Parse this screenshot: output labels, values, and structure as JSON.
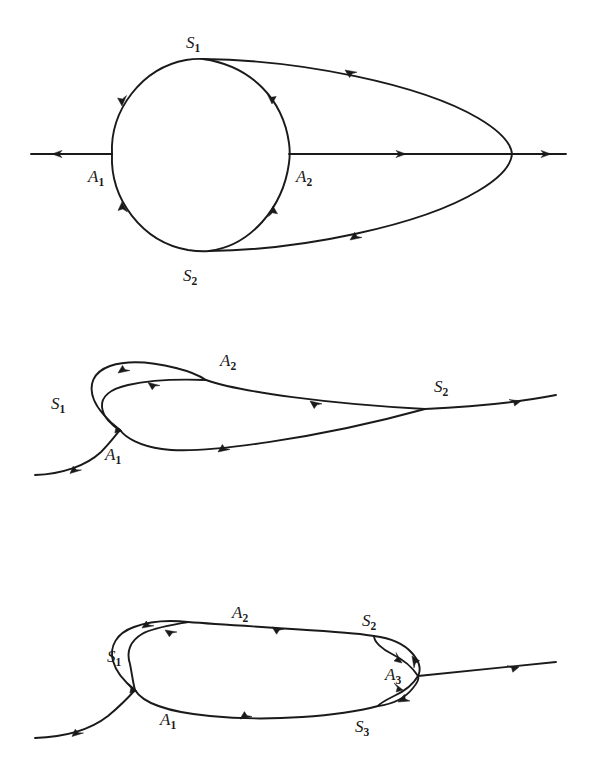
{
  "page": {
    "background_color": "#ffffff",
    "ink_color": "#1a1a1a",
    "width": 592,
    "height": 761,
    "figure_count": 3
  },
  "figures": [
    {
      "id": "figure-1",
      "name": "two-saddle-circle-with-outer-loop",
      "labels": [
        {
          "id": "f1-S1",
          "base": "S",
          "sub": "1",
          "x": 186,
          "y": 48,
          "role": "saddle-point-label"
        },
        {
          "id": "f1-A1",
          "base": "A",
          "sub": "1",
          "x": 88,
          "y": 182,
          "role": "equilibrium-point-label"
        },
        {
          "id": "f1-A2",
          "base": "A",
          "sub": "2",
          "x": 296,
          "y": 182,
          "role": "equilibrium-point-label"
        },
        {
          "id": "f1-S2",
          "base": "S",
          "sub": "2",
          "x": 183,
          "y": 281,
          "role": "saddle-point-label"
        }
      ]
    },
    {
      "id": "figure-2",
      "name": "single-cusp-homoclinic-loop",
      "labels": [
        {
          "id": "f2-A2",
          "base": "A",
          "sub": "2",
          "x": 220,
          "y": 66,
          "role": "equilibrium-point-label"
        },
        {
          "id": "f2-S1",
          "base": "S",
          "sub": "1",
          "x": 51,
          "y": 109,
          "role": "saddle-point-label"
        },
        {
          "id": "f2-S2",
          "base": "S",
          "sub": "2",
          "x": 434,
          "y": 92,
          "role": "saddle-point-label"
        },
        {
          "id": "f2-A1",
          "base": "A",
          "sub": "1",
          "x": 105,
          "y": 160,
          "role": "equilibrium-point-label"
        }
      ]
    },
    {
      "id": "figure-3",
      "name": "three-saddle-double-cusp-loop",
      "labels": [
        {
          "id": "f3-A2",
          "base": "A",
          "sub": "2",
          "x": 232,
          "y": 98,
          "role": "equilibrium-point-label"
        },
        {
          "id": "f3-S2",
          "base": "S",
          "sub": "2",
          "x": 362,
          "y": 106,
          "role": "saddle-point-label"
        },
        {
          "id": "f3-S1",
          "base": "S",
          "sub": "1",
          "x": 107,
          "y": 142,
          "role": "saddle-point-label"
        },
        {
          "id": "f3-A3",
          "base": "A",
          "sub": "3",
          "x": 385,
          "y": 160,
          "role": "equilibrium-point-label"
        },
        {
          "id": "f3-A1",
          "base": "A",
          "sub": "1",
          "x": 160,
          "y": 205,
          "role": "equilibrium-point-label"
        },
        {
          "id": "f3-S3",
          "base": "S",
          "sub": "3",
          "x": 355,
          "y": 212,
          "role": "saddle-point-label"
        }
      ]
    }
  ]
}
